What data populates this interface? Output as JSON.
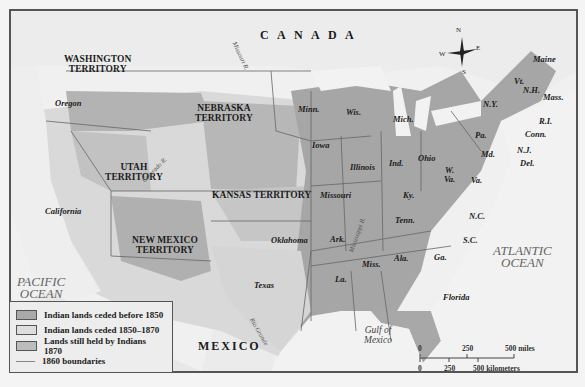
{
  "map": {
    "countries": {
      "canada": "C A N A D A",
      "mexico": "MEXICO"
    },
    "oceans": {
      "pacific_line1": "PACIFIC",
      "pacific_line2": "OCEAN",
      "atlantic_line1": "ATLANTIC",
      "atlantic_line2": "OCEAN",
      "gulf_line1": "Gulf of",
      "gulf_line2": "Mexico"
    },
    "territories": {
      "washington": [
        "WASHINGTON",
        "TERRITORY"
      ],
      "nebraska": [
        "NEBRASKA",
        "TERRITORY"
      ],
      "utah": [
        "UTAH",
        "TERRITORY"
      ],
      "kansas": "KANSAS TERRITORY",
      "new_mexico": [
        "NEW MEXICO",
        "TERRITORY"
      ]
    },
    "states": {
      "oregon": "Oregon",
      "california": "California",
      "texas": "Texas",
      "oklahoma": "Oklahoma",
      "minn": "Minn.",
      "wis": "Wis.",
      "mich": "Mich.",
      "iowa": "Iowa",
      "illinois": "Illinois",
      "ind": "Ind.",
      "ohio": "Ohio",
      "missouri": "Missouri",
      "ky": "Ky.",
      "w_va_1": "W.",
      "w_va_2": "Va.",
      "va": "Va.",
      "md": "Md.",
      "del": "Del.",
      "nj": "N.J.",
      "pa": "Pa.",
      "ny": "N.Y.",
      "conn": "Conn.",
      "ri": "R.I.",
      "mass": "Mass.",
      "nh": "N.H.",
      "vt": "Vt.",
      "maine": "Maine",
      "tenn": "Tenn.",
      "nc": "N.C.",
      "sc": "S.C.",
      "ga": "Ga.",
      "ala": "Ala.",
      "miss": "Miss.",
      "ark": "Ark.",
      "la": "La.",
      "florida": "Florida"
    },
    "rivers": {
      "missouri": "Missouri R.",
      "colorado": "Colorado R.",
      "mississippi": "Mississippi R.",
      "rio_grande": "Rio Grande"
    },
    "compass": {
      "n": "N",
      "s": "S",
      "e": "E",
      "w": "W"
    },
    "colors": {
      "ceded_before_1850": "#a9a9a9",
      "ceded_1850_1870": "#dcdcdc",
      "held_1870": "#bdbdbd",
      "boundary": "#6a6a6a",
      "water": "#f2f2f2",
      "land_bg": "#e4e4e4"
    }
  },
  "legend": {
    "items": [
      {
        "label": "Indian lands ceded before 1850",
        "swatch": "#a9a9a9"
      },
      {
        "label": "Indian lands ceded 1850–1870",
        "swatch": "#dedede"
      },
      {
        "label": "Lands still held by Indians 1870",
        "swatch": "#bcbcbc"
      },
      {
        "label": "1860 boundaries",
        "swatch": "line"
      }
    ]
  },
  "scale": {
    "miles": {
      "zero": "0",
      "mid": "250",
      "end": "500 miles"
    },
    "km": {
      "zero": "0",
      "mid": "250",
      "end": "500 kilometers"
    }
  }
}
